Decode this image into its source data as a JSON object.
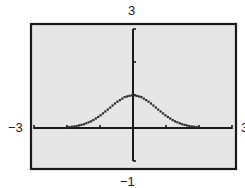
{
  "chart_data": {
    "type": "line",
    "title": "",
    "xlabel": "",
    "ylabel": "",
    "xlim": [
      -3,
      3
    ],
    "ylim": [
      -1,
      3
    ],
    "xscale": 1,
    "yscale": 1,
    "grid": false,
    "window_labels": {
      "ymax": "3",
      "ymin": "−1",
      "xmin": "−3",
      "xmax": "3"
    },
    "x_ticks": [
      -3,
      -2,
      -1,
      0,
      1,
      2,
      3
    ],
    "y_ticks": [
      -1,
      0,
      1,
      2,
      3
    ],
    "series": [
      {
        "name": "f(x)",
        "style": "dotted-pixel",
        "x": [
          -3,
          -2.5,
          -2,
          -1.75,
          -1.5,
          -1.25,
          -1,
          -0.75,
          -0.5,
          -0.25,
          0,
          0.25,
          0.5,
          0.75,
          1,
          1.25,
          1.5,
          1.75,
          2,
          2.5,
          3
        ],
        "y": [
          0.0,
          0.0,
          0.02,
          0.05,
          0.11,
          0.21,
          0.37,
          0.57,
          0.78,
          0.94,
          1.0,
          0.94,
          0.78,
          0.57,
          0.37,
          0.21,
          0.11,
          0.05,
          0.02,
          0.0,
          0.0
        ]
      }
    ]
  },
  "colors": {
    "background": "#e6e6e6",
    "frame": "#1a1a1a",
    "axes": "#1a1a1a",
    "curve": "#2a2a2a"
  }
}
